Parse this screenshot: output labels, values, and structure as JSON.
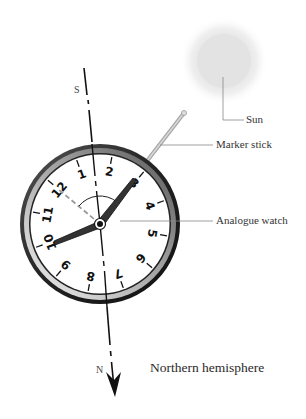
{
  "diagram": {
    "title": "Northern hemisphere",
    "labels": {
      "sun": "Sun",
      "marker_stick": "Marker stick",
      "watch": "Analogue watch",
      "south": "S",
      "north": "N"
    },
    "watch_numbers": [
      "12",
      "1",
      "2",
      "3",
      "4",
      "5",
      "6",
      "7",
      "8",
      "9",
      "10",
      "11"
    ],
    "colors": {
      "sun": "#e4e4e4",
      "rim": "#2a2a2a",
      "stick": "#b8b8b8",
      "leader": "#888888"
    }
  }
}
